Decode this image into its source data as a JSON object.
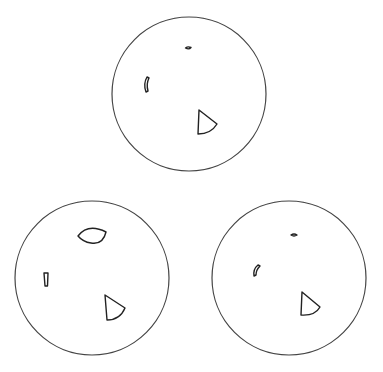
{
  "diagram": {
    "width": 383,
    "height": 372,
    "background": "#ffffff",
    "stroke_color": "#222222",
    "circle_stroke_color": "#444444",
    "circles": [
      {
        "id": "top",
        "cx": 189,
        "cy": 94,
        "r": 77,
        "shapes": [
          {
            "type": "blob",
            "path": "M185.5,48 Q188,46 191,47.5 Q189,50 185.5,48 Z"
          },
          {
            "type": "arc",
            "path": "M147,77 Q143,84 146,92 L148,91 Q146,84 149,78 Z"
          },
          {
            "type": "sector",
            "path": "M199,110 L198,134 Q211,134 217,124 Z"
          }
        ]
      },
      {
        "id": "bottom-left",
        "cx": 92,
        "cy": 278,
        "r": 77,
        "shapes": [
          {
            "type": "eye",
            "path": "M78,236 Q88,223 106,232 Q103,245 91,243 Q83,242 78,236 Z"
          },
          {
            "type": "rect-tab",
            "path": "M44,273 L48,273 L47.5,286 L45,286 Z"
          },
          {
            "type": "sector",
            "path": "M105,295 L107,320 Q120,320 125,308 Z"
          }
        ]
      },
      {
        "id": "bottom-right",
        "cx": 289,
        "cy": 278,
        "r": 77,
        "shapes": [
          {
            "type": "blob",
            "path": "M291,235 Q294,233 297,235 Q294,237 291,235 Z"
          },
          {
            "type": "arc",
            "path": "M258,265 Q253,269 254,276 L256,275 Q256,270 260,266 Z"
          },
          {
            "type": "sector",
            "path": "M302,292 L301,315 Q315,316 320,307 Z"
          }
        ]
      }
    ]
  }
}
